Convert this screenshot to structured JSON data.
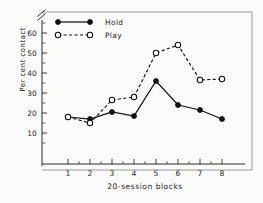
{
  "chart_data": {
    "type": "line",
    "title": "",
    "xlabel": "20-session blocks",
    "ylabel": "Per cent contact",
    "categories": [
      "1",
      "2",
      "3",
      "4",
      "5",
      "6",
      "7",
      "8"
    ],
    "x": [
      1,
      2,
      3,
      4,
      5,
      6,
      7,
      8
    ],
    "xlim": [
      0.55,
      8.45
    ],
    "ylim": [
      0,
      66
    ],
    "yticks": [
      10,
      20,
      30,
      40,
      50,
      60
    ],
    "ytick_labels": [
      "10",
      "20",
      "30",
      "40",
      "50",
      "60"
    ],
    "xticks": [
      1,
      2,
      3,
      4,
      5,
      6,
      7,
      8
    ],
    "xtick_labels": [
      "1",
      "2",
      "3",
      "4",
      "5",
      "6",
      "7",
      "8"
    ],
    "grid": false,
    "axis_break": {
      "present": true,
      "position": "top-of-y-axis",
      "symbol": "//"
    },
    "legend_position": "top-left-inside",
    "series": [
      {
        "name": "Hold",
        "marker": "filled-circle",
        "linestyle": "solid",
        "color": "#111111",
        "values": [
          18,
          17,
          20.5,
          18.5,
          36,
          24,
          21.5,
          17
        ]
      },
      {
        "name": "Play",
        "marker": "open-circle",
        "linestyle": "dashed",
        "color": "#111111",
        "values": [
          18,
          15,
          26.5,
          28,
          50,
          54,
          36.5,
          37
        ]
      }
    ]
  },
  "legend": {
    "entries": [
      {
        "label": "Hold"
      },
      {
        "label": "Play"
      }
    ]
  },
  "axes": {
    "y_title": "Per cent contact",
    "x_title": "20-session blocks"
  }
}
